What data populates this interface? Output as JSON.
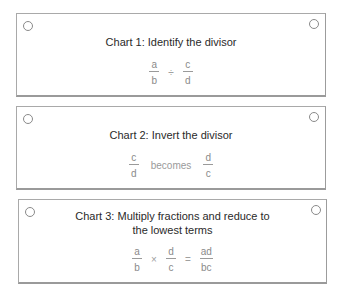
{
  "charts": [
    {
      "title": "Chart 1: Identify the divisor",
      "expression": {
        "left": {
          "numerator": "a",
          "denominator": "b"
        },
        "operator": "÷",
        "right": {
          "numerator": "c",
          "denominator": "d"
        }
      }
    },
    {
      "title": "Chart 2: Invert the divisor",
      "expression": {
        "left": {
          "numerator": "c",
          "denominator": "d"
        },
        "connector": "becomes",
        "right": {
          "numerator": "d",
          "denominator": "c"
        }
      }
    },
    {
      "title_line1": "Chart 3: Multiply fractions and reduce to",
      "title_line2": "the lowest terms",
      "expression": {
        "left": {
          "numerator": "a",
          "denominator": "b"
        },
        "operator": "×",
        "middle": {
          "numerator": "d",
          "denominator": "c"
        },
        "equals": "=",
        "result": {
          "numerator": "ad",
          "denominator": "bc"
        }
      }
    }
  ],
  "colors": {
    "border": "#a9a9a9",
    "title_text": "#2a2a2a",
    "math_text": "#8a8a8a"
  }
}
